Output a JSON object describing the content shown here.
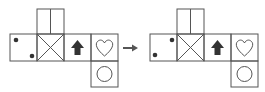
{
  "diagram": {
    "type": "cube-net-transformation",
    "colors": {
      "stroke": "#555555",
      "fill": "#333333",
      "background": "#ffffff"
    },
    "left_net": {
      "cells": [
        {
          "position": "row-1",
          "symbol": "two-dots",
          "dots": "top-left, bottom-right"
        },
        {
          "position": "row-2",
          "symbol": "x-cross"
        },
        {
          "position": "row-3",
          "symbol": "up-arrow"
        },
        {
          "position": "row-4",
          "symbol": "heart"
        },
        {
          "position": "top-of-2",
          "symbol": "vertical-split"
        },
        {
          "position": "bottom-of-4",
          "symbol": "circle"
        }
      ]
    },
    "arrow": {
      "symbol": "right-arrow"
    },
    "right_net": {
      "cells": [
        {
          "position": "row-1",
          "symbol": "two-dots",
          "dots": "top-right, bottom-left"
        },
        {
          "position": "row-2",
          "symbol": "x-cross"
        },
        {
          "position": "row-3",
          "symbol": "up-arrow"
        },
        {
          "position": "row-4",
          "symbol": "heart"
        },
        {
          "position": "top-of-2",
          "symbol": "vertical-split"
        },
        {
          "position": "bottom-of-4",
          "symbol": "circle"
        }
      ]
    }
  }
}
